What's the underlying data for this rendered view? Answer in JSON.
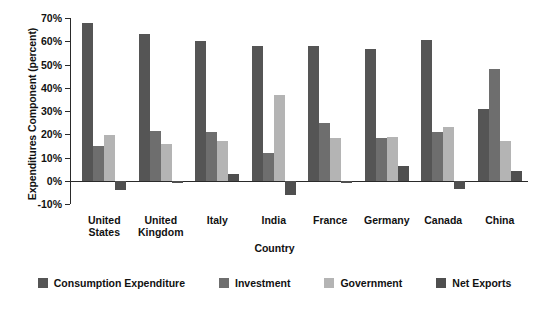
{
  "chart_data": {
    "type": "bar",
    "title": "",
    "xlabel": "Country",
    "ylabel": "Expenditures Component (percent)",
    "categories": [
      "United States",
      "United Kingdom",
      "Italy",
      "India",
      "France",
      "Germany",
      "Canada",
      "China"
    ],
    "category_lines": [
      [
        "United",
        "States"
      ],
      [
        "United",
        "Kingdom"
      ],
      [
        "Italy"
      ],
      [
        "India"
      ],
      [
        "France"
      ],
      [
        "Germany"
      ],
      [
        "Canada"
      ],
      [
        "China"
      ]
    ],
    "series": [
      {
        "name": "Consumption Expenditure",
        "color": "#555555",
        "values": [
          68,
          63,
          60,
          58,
          58,
          56.5,
          60.5,
          31
        ]
      },
      {
        "name": "Investment",
        "color": "#6e6e6e",
        "values": [
          15,
          21.5,
          21,
          12,
          25,
          18.5,
          21,
          48
        ]
      },
      {
        "name": "Government",
        "color": "#b4b4b4",
        "values": [
          19.5,
          16,
          17,
          37,
          18.5,
          19,
          23,
          17
        ]
      },
      {
        "name": "Net Exports",
        "color": "#4f4f4f",
        "values": [
          -4,
          -1,
          3,
          -6,
          -1,
          6.5,
          -3.5,
          4
        ]
      }
    ],
    "ylim": [
      -10,
      70
    ],
    "yticks": [
      -10,
      0,
      10,
      20,
      30,
      40,
      50,
      60,
      70
    ],
    "ytick_labels": [
      "-10%",
      "0%",
      "10%",
      "20%",
      "30%",
      "40%",
      "50%",
      "60%",
      "70%"
    ],
    "grid": false,
    "legend_position": "bottom"
  }
}
